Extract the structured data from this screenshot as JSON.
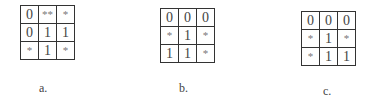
{
  "figures": [
    {
      "id": "a",
      "label": "a.",
      "cells": [
        [
          "0",
          "**",
          "*"
        ],
        [
          "0",
          "1",
          "1"
        ],
        [
          "*",
          "1",
          "*"
        ]
      ]
    },
    {
      "id": "b",
      "label": "b.",
      "cells": [
        [
          "0",
          "0",
          "0"
        ],
        [
          "*",
          "1",
          "*"
        ],
        [
          "1",
          "1",
          "*"
        ]
      ]
    },
    {
      "id": "c",
      "label": "c.",
      "cells": [
        [
          "0",
          "0",
          "0"
        ],
        [
          "*",
          "1",
          "*"
        ],
        [
          "*",
          "1",
          "1"
        ]
      ]
    }
  ],
  "colors": {
    "border": "#333333",
    "digit": "#444444",
    "asterisk": "#777777",
    "background": "#ffffff"
  }
}
